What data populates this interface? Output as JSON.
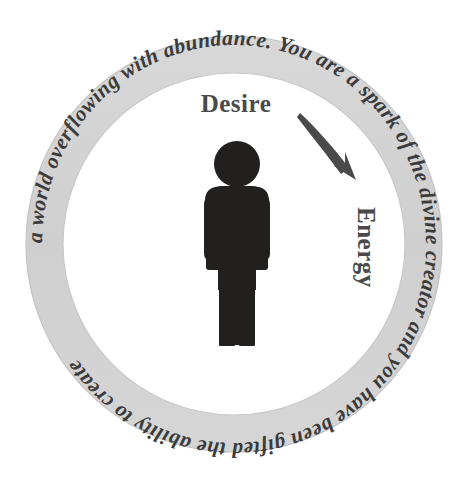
{
  "diagram": {
    "ring": {
      "text": "a world overflowing with abundance. You are a spark of the divine creator and you have been gifted the ability to create ",
      "full_sentence": "You are a spark of the divine creator and you have been gifted the ability to create a world overflowing with abundance.",
      "band_color": "#d2d2d2",
      "band_edge_color": "#c2c2c2",
      "text_color": "#3b3b3b"
    },
    "labels": {
      "desire": "Desire",
      "energy": "Energy",
      "label_color": "#4a4a4a"
    },
    "figure": {
      "name": "person-pictogram",
      "color": "#221f1f"
    },
    "arrow": {
      "name": "curved-arrow",
      "color": "#4a4a4a",
      "direction": "clockwise-down-right"
    },
    "background_color": "#ffffff"
  }
}
